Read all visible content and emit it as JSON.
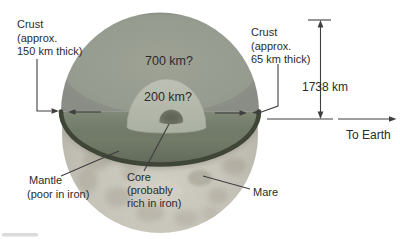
{
  "figure": {
    "labels": {
      "crust_left": {
        "line1": "Crust",
        "line2": "(approx.",
        "line3": "150 km thick)"
      },
      "crust_right": {
        "line1": "Crust",
        "line2": "(approx.",
        "line3": "65 km thick)"
      },
      "upper_mantle_depth": "700 km?",
      "inner_layer_depth": "200 km?",
      "radius": "1738 km",
      "direction": "To Earth",
      "mantle": {
        "line1": "Mantle",
        "line2": "(poor in iron)"
      },
      "core": {
        "line1": "Core",
        "line2": "(probably",
        "line3": "rich in iron)"
      },
      "mare": "Mare"
    },
    "colors": {
      "background": "#ffffff",
      "cut_face": "#989d92",
      "face_rim_band": "#8c9089",
      "equator_plane": "#747d6a",
      "rim_edge": "#404637",
      "layer_200": "#b5b9ad",
      "core": "#666a5e",
      "moon_surface": "#c9c6bb",
      "moon_maria": "#a29d90",
      "line": "#3f3f3f",
      "text": "#2b2b2b"
    }
  }
}
